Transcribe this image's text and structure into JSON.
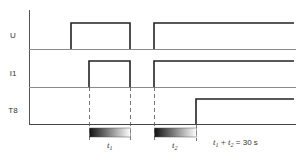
{
  "diagram": {
    "type": "timing-diagram",
    "signals": [
      {
        "id": "U",
        "label": "U"
      },
      {
        "id": "I1",
        "label": "I1"
      },
      {
        "id": "T8",
        "label": "T8"
      }
    ],
    "intervals": [
      {
        "id": "t1",
        "label": "t",
        "subscript": "1"
      },
      {
        "id": "t2",
        "label": "t",
        "subscript": "2"
      }
    ],
    "equation": {
      "t1": "t",
      "t1_sub": "1",
      "plus": " + ",
      "t2": "t",
      "t2_sub": "2",
      "rhs": " = 30 s"
    },
    "colors": {
      "signal_line": "#222222",
      "axis_line": "#555555",
      "baseline": "#888888",
      "dash": "#555555",
      "gradient_start": "#111111",
      "gradient_end": "#ffffff"
    }
  }
}
